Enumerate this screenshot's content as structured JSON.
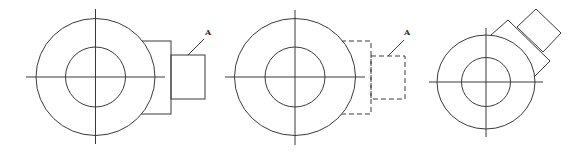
{
  "diagram": {
    "figures": [
      {
        "id": "figure-1",
        "style": "solid",
        "label": "A",
        "center": [
          95.5,
          77
        ],
        "outer_radius": [
          59.5,
          58.5
        ],
        "inner_radius": 30,
        "crosshair": {
          "h": [
            26,
            165
          ],
          "v": [
            9,
            144
          ]
        },
        "large_rect": {
          "x1": 140,
          "y1": 41,
          "x2": 171,
          "y2": 114
        },
        "small_rect": {
          "x1": 171,
          "y1": 55,
          "x2": 205,
          "y2": 99
        },
        "leader": {
          "from": [
            188,
            55
          ],
          "to": [
            204,
            39
          ]
        },
        "label_pos": [
          205,
          35
        ]
      },
      {
        "id": "figure-2",
        "style": "dashed",
        "label": "A",
        "center": [
          295,
          77
        ],
        "outer_radius": [
          60.5,
          58.5
        ],
        "inner_radius": 30,
        "crosshair": {
          "h": [
            225,
            365
          ],
          "v": [
            10,
            145
          ]
        },
        "large_rect": {
          "x1": 341,
          "y1": 41,
          "x2": 371,
          "y2": 114
        },
        "small_rect": {
          "x1": 371,
          "y1": 56,
          "x2": 405,
          "y2": 99
        },
        "leader": {
          "from": [
            388,
            56
          ],
          "to": [
            404,
            40
          ]
        },
        "label_pos": [
          404,
          35
        ]
      },
      {
        "id": "figure-3",
        "style": "solid-rotated",
        "label": "",
        "center": [
          486,
          82
        ],
        "outer_radius": [
          49,
          47
        ],
        "inner_radius": 24.5,
        "crosshair": {
          "h": [
            429,
            543
          ],
          "v": [
            28,
            137
          ]
        },
        "large_rect_points": "491,35 508,20 550,61 534,77",
        "small_rect_points": "517,27 536,9 561,33 543,52"
      }
    ]
  }
}
